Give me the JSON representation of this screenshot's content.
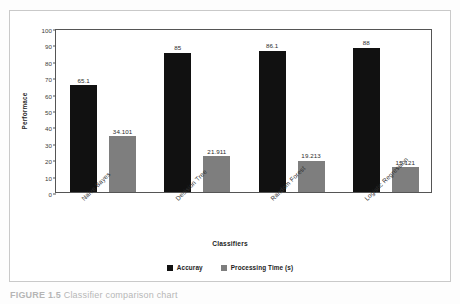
{
  "chart_data": {
    "type": "bar",
    "title": "",
    "subtitle": "",
    "xlabel": "Classifiers",
    "ylabel": "Performace",
    "ylim": [
      0,
      100
    ],
    "yticks": [
      "0",
      "10",
      "20",
      "30",
      "40",
      "50",
      "60",
      "70",
      "80",
      "90",
      "100"
    ],
    "grid": false,
    "legend_position": "bottom-center",
    "categories": [
      "Naive Bayes",
      "Decision Tree",
      "Random Forest",
      "Logistic Regression"
    ],
    "series": [
      {
        "name": "Accuray",
        "color": "#111111",
        "values": [
          65.1,
          85,
          86.1,
          88
        ],
        "value_labels": [
          "65.1",
          "85",
          "86.1",
          "88"
        ]
      },
      {
        "name": "Processing Time (s)",
        "color": "#7e7e7e",
        "values": [
          34.101,
          21.911,
          19.213,
          15.121
        ],
        "value_labels": [
          "34.101",
          "21.911",
          "19.213",
          "15.121"
        ]
      }
    ]
  },
  "legend": {
    "items": [
      {
        "label": "Accuray",
        "color": "#111111"
      },
      {
        "label": "Processing Time (s)",
        "color": "#7e7e7e"
      }
    ]
  },
  "caption": {
    "label": "FIGURE 1.5",
    "text": "Classifier comparison chart"
  }
}
